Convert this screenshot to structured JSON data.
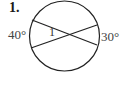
{
  "problem": {
    "number": "1.",
    "arc_left": "40°",
    "arc_right": "30°",
    "angle_label": "1"
  },
  "figure": {
    "shape": "circle with two intersecting chords",
    "stroke_color": "#222222"
  }
}
